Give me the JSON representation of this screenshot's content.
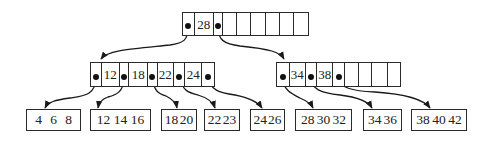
{
  "diagram": {
    "type": "B-tree",
    "root": {
      "keys": [
        "28"
      ],
      "cells": [
        {
          "kind": "ptr",
          "w": 12
        },
        {
          "kind": "key",
          "label": "28",
          "w": 19
        },
        {
          "kind": "ptr",
          "w": 10
        },
        {
          "kind": "empty",
          "w": 14
        },
        {
          "kind": "empty",
          "w": 14
        },
        {
          "kind": "empty",
          "w": 15
        },
        {
          "kind": "empty",
          "w": 15
        },
        {
          "kind": "empty",
          "w": 14
        },
        {
          "kind": "empty",
          "w": 14
        }
      ]
    },
    "internal_left": {
      "keys": [
        "12",
        "18",
        "22",
        "24"
      ],
      "labels": {
        "k1": "12",
        "k2": "18",
        "k3": "22",
        "k4": "24"
      }
    },
    "internal_right": {
      "keys": [
        "34",
        "38"
      ],
      "labels": {
        "k1": "34",
        "k2": "38"
      }
    },
    "root_labels": {
      "k1": "28"
    },
    "leaves": [
      {
        "values": [
          "4",
          "6",
          "8"
        ]
      },
      {
        "values": [
          "12",
          "14",
          "16"
        ]
      },
      {
        "values": [
          "18",
          "20"
        ]
      },
      {
        "values": [
          "22",
          "23"
        ]
      },
      {
        "values": [
          "24",
          "26"
        ]
      },
      {
        "values": [
          "28",
          "30",
          "32"
        ]
      },
      {
        "values": [
          "34",
          "36"
        ]
      },
      {
        "values": [
          "38",
          "40",
          "42"
        ]
      }
    ],
    "colors": {
      "line": "#2a2a2a",
      "dot": "#111111",
      "background": "#ffffff"
    }
  }
}
